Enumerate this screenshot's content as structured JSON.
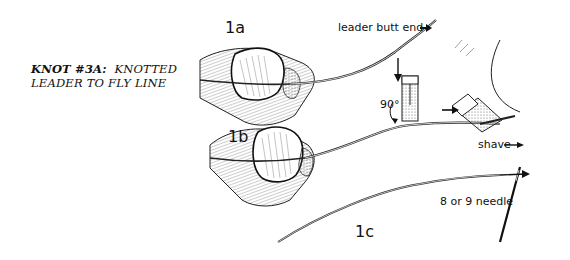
{
  "title": {
    "bold": "KNOT #3A:",
    "line1_rest": "KNOTTED",
    "line2": "LEADER TO FLY LINE"
  },
  "steps": [
    {
      "id": "1a",
      "label": "1a"
    },
    {
      "id": "1b",
      "label": "1b"
    },
    {
      "id": "1c",
      "label": "1c"
    }
  ],
  "annotations": {
    "leader_butt_end": "leader butt end",
    "angle": "90°",
    "shave": "shave",
    "needle": "8 or 9 needle"
  },
  "colors": {
    "ink": "#111111",
    "background": "#ffffff",
    "shade": "#9a9a9a"
  }
}
